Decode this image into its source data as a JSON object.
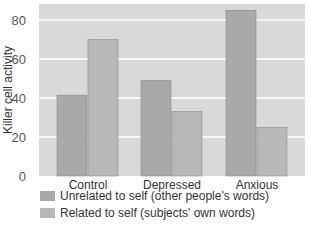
{
  "chart_data": {
    "type": "bar",
    "title": "",
    "xlabel": "",
    "ylabel": "Killer cell activity",
    "ylim": [
      0,
      80
    ],
    "yticks": [
      "0",
      "20",
      "40",
      "60",
      "80"
    ],
    "grid": true,
    "categories": [
      "Control",
      "Depressed",
      "Anxious"
    ],
    "series": [
      {
        "name": "Unrelated to self (other people's words)",
        "values": [
          41.5,
          49,
          85
        ],
        "color": "#a9a9a9"
      },
      {
        "name": "Related to self (subjects' own words)",
        "values": [
          70,
          33,
          25
        ],
        "color": "#b8b8b8"
      }
    ],
    "legend_position": "bottom-left",
    "background_color": "#d9d9d9",
    "gridline_color": "#ffffff"
  }
}
